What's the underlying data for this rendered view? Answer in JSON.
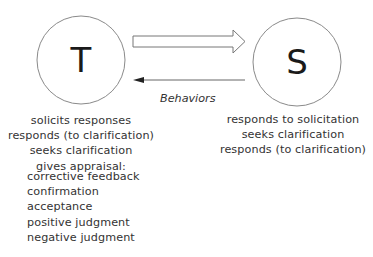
{
  "diagram": {
    "nodes": [
      {
        "id": "teacher",
        "label": "T"
      },
      {
        "id": "student",
        "label": "S"
      }
    ],
    "edges": [
      {
        "from": "T",
        "to": "S",
        "style": "hollow-block-arrow"
      },
      {
        "from": "S",
        "to": "T",
        "style": "thin-line-arrow"
      }
    ],
    "edge_label": "Behaviors",
    "teacher_behaviors": [
      "solicits responses",
      "responds (to clarification)",
      "seeks clarification",
      "gives appraisal:"
    ],
    "appraisal_types": [
      "corrective feedback",
      "confirmation",
      "acceptance",
      "positive judgment",
      "negative judgment"
    ],
    "student_behaviors": [
      "responds to solicitation",
      "seeks clarification",
      "responds (to clarification)"
    ],
    "colors": {
      "stroke": "#777777",
      "text": "#333333",
      "letter": "#1a1a1a"
    }
  }
}
